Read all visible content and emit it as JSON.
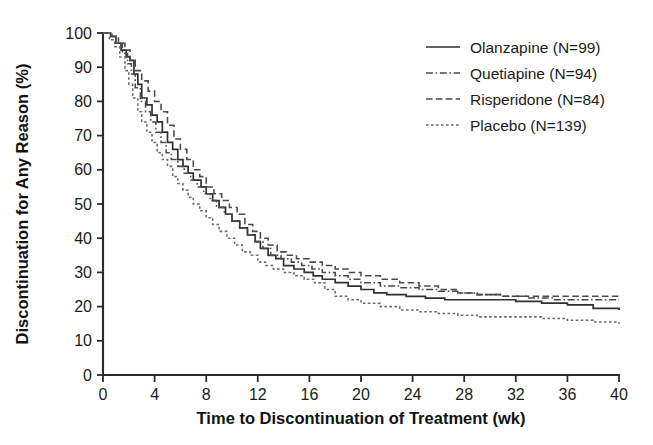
{
  "chart_data": {
    "type": "line",
    "subtype": "kaplan-meier-step",
    "title": "",
    "xlabel": "Time to Discontinuation of Treatment (wk)",
    "ylabel": "Discontinuation for Any Reason (%)",
    "xlim": [
      0,
      40
    ],
    "ylim": [
      0,
      100
    ],
    "xticks": [
      0,
      4,
      8,
      12,
      16,
      20,
      24,
      28,
      32,
      36,
      40
    ],
    "yticks": [
      0,
      10,
      20,
      30,
      40,
      50,
      60,
      70,
      80,
      90,
      100
    ],
    "xtick_labels": [
      "0",
      "4",
      "8",
      "12",
      "16",
      "20",
      "24",
      "28",
      "32",
      "36",
      "40"
    ],
    "ytick_labels": [
      "0",
      "10",
      "20",
      "30",
      "40",
      "50",
      "60",
      "70",
      "80",
      "90",
      "100"
    ],
    "grid": false,
    "frame": "left-bottom",
    "legend_position": "upper-right",
    "series": [
      {
        "name": "Olanzapine (N=99)",
        "label": "Olanzapine (N=99)",
        "n": 99,
        "line_style": "solid",
        "color": "#303030",
        "x": [
          0,
          0.6,
          1.0,
          1.4,
          1.8,
          2.1,
          2.4,
          2.7,
          3.0,
          3.4,
          3.8,
          4.2,
          4.6,
          5.0,
          5.4,
          5.8,
          6.2,
          6.6,
          7.0,
          7.6,
          8.0,
          8.5,
          9.0,
          9.5,
          10.0,
          10.6,
          11.2,
          11.8,
          12.2,
          12.8,
          13.4,
          14.0,
          14.8,
          15.6,
          16.3,
          17.0,
          18.0,
          19.0,
          20.0,
          21.0,
          22.0,
          23.5,
          25.0,
          26.5,
          28.0,
          30.0,
          32.0,
          34.0,
          36.0,
          38.0,
          40.0
        ],
        "y": [
          100,
          99,
          97,
          95,
          93,
          92,
          88,
          85,
          81,
          79,
          76,
          74,
          71,
          68,
          66,
          63,
          61,
          59,
          57,
          55,
          53,
          51,
          49,
          47,
          45,
          43,
          41,
          39,
          37,
          35,
          34,
          32,
          31,
          30,
          29,
          28,
          27,
          26,
          25,
          24,
          23.5,
          23,
          22.5,
          22,
          22,
          22,
          21.5,
          21,
          20.5,
          19.5,
          19
        ],
        "final_value": 19
      },
      {
        "name": "Quetiapine (N=94)",
        "label": "Quetiapine (N=94)",
        "n": 94,
        "line_style": "dash-dot",
        "color": "#4a4a4a",
        "x": [
          0,
          0.6,
          1.0,
          1.5,
          1.9,
          2.2,
          2.5,
          2.9,
          3.3,
          3.7,
          4.1,
          4.5,
          4.9,
          5.3,
          5.8,
          6.3,
          6.8,
          7.3,
          7.8,
          8.3,
          8.8,
          9.4,
          10.0,
          10.6,
          11.2,
          11.8,
          12.4,
          13.0,
          13.8,
          14.6,
          15.4,
          16.2,
          17.0,
          18.0,
          19.0,
          20.0,
          21.5,
          23.0,
          24.5,
          26.0,
          27.5,
          29.0,
          31.0,
          33.0,
          35.0,
          37.0,
          39.0,
          40.0
        ],
        "y": [
          100,
          99,
          97,
          94,
          91,
          88,
          84,
          80,
          77,
          74,
          71,
          68,
          65,
          63,
          61,
          59,
          57,
          55,
          53,
          51,
          49,
          47,
          45,
          43,
          41,
          39,
          37,
          35,
          34,
          33,
          32,
          31,
          30,
          29,
          28,
          27,
          26,
          25.5,
          25,
          24.5,
          24,
          23.5,
          23,
          22.5,
          22,
          22,
          22,
          22
        ],
        "final_value": 22
      },
      {
        "name": "Risperidone (N=84)",
        "label": "Risperidone (N=84)",
        "n": 84,
        "line_style": "dashed",
        "color": "#4a4a4a",
        "x": [
          0,
          0.7,
          1.2,
          1.7,
          2.1,
          2.5,
          3.0,
          3.5,
          4.0,
          4.5,
          5.0,
          5.5,
          6.0,
          6.5,
          7.0,
          7.5,
          8.0,
          8.6,
          9.2,
          9.8,
          10.4,
          11.0,
          11.6,
          12.2,
          12.8,
          13.5,
          14.2,
          15.0,
          16.0,
          17.0,
          18.0,
          19.0,
          20.0,
          21.5,
          23.0,
          24.5,
          26.0,
          27.5,
          29.0,
          31.0,
          33.0,
          35.0,
          37.0,
          39.0,
          40.0
        ],
        "y": [
          100,
          99,
          97,
          95,
          92,
          89,
          86,
          83,
          80,
          77,
          73,
          69,
          66,
          63,
          60,
          58,
          55,
          53,
          51,
          49,
          47,
          44,
          42,
          40,
          38,
          36,
          35,
          34,
          33,
          32,
          31,
          30,
          29,
          28,
          27,
          26,
          25,
          24,
          23.5,
          23,
          23,
          23,
          23,
          23,
          23
        ],
        "final_value": 23
      },
      {
        "name": "Placebo (N=139)",
        "label": "Placebo (N=139)",
        "n": 139,
        "line_style": "dotted",
        "color": "#6a6a6a",
        "x": [
          0,
          0.5,
          0.9,
          1.3,
          1.7,
          2.0,
          2.3,
          2.7,
          3.0,
          3.4,
          3.8,
          4.2,
          4.6,
          5.0,
          5.4,
          5.8,
          6.2,
          6.6,
          7.0,
          7.5,
          8.0,
          8.5,
          9.0,
          9.6,
          10.2,
          10.8,
          11.4,
          12.0,
          12.6,
          13.2,
          14.0,
          14.8,
          15.6,
          16.4,
          17.2,
          18.0,
          19.0,
          20.0,
          21.5,
          23.0,
          24.5,
          26.0,
          27.5,
          29.0,
          30.5,
          32.0,
          34.0,
          36.0,
          38.0,
          40.0
        ],
        "y": [
          100,
          98,
          96,
          93,
          89,
          85,
          81,
          77,
          74,
          71,
          68,
          65,
          63,
          61,
          58,
          56,
          54,
          52,
          50,
          48,
          46,
          44,
          42,
          40,
          38,
          36,
          35,
          33,
          32,
          31,
          30,
          29,
          28,
          27,
          25,
          23,
          22,
          21,
          20,
          19,
          18.5,
          18,
          17.5,
          17,
          17,
          17,
          16.5,
          16,
          15.5,
          15
        ],
        "final_value": 15
      }
    ]
  },
  "axes": {
    "x_title": "Time to Discontinuation of Treatment (wk)",
    "y_title": "Discontinuation for Any Reason (%)"
  },
  "legend": {
    "entries": [
      {
        "label": "Olanzapine (N=99)"
      },
      {
        "label": "Quetiapine (N=94)"
      },
      {
        "label": "Risperidone (N=84)"
      },
      {
        "label": "Placebo (N=139)"
      }
    ]
  },
  "colors": {
    "axis": "#2b2b2b",
    "text": "#1b1b1b",
    "olanzapine": "#303030",
    "quetiapine": "#4a4a4a",
    "risperidone": "#4a4a4a",
    "placebo": "#6a6a6a",
    "background": "#ffffff"
  }
}
